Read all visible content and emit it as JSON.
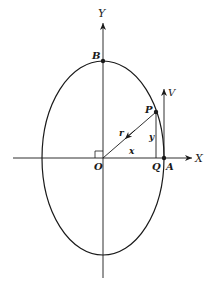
{
  "diagram": {
    "type": "ellipse-motion",
    "labels": {
      "y_axis": "Y",
      "x_axis": "X",
      "origin": "O",
      "point_b": "B",
      "point_p": "P",
      "point_q": "Q",
      "point_a": "A",
      "velocity": "V",
      "radius": "r",
      "x_coord": "x",
      "y_coord": "y"
    },
    "colors": {
      "stroke": "#1a1a1a",
      "background": "#ffffff"
    }
  }
}
